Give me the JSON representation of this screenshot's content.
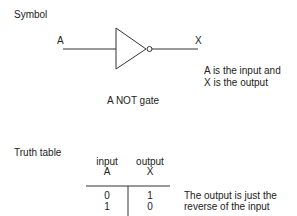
{
  "symbol_section": {
    "heading": "Symbol",
    "input_label": "A",
    "output_label": "X",
    "note_line1": "A is the input and",
    "note_line2": "X is the output",
    "caption": "A NOT gate"
  },
  "truth_table_section": {
    "heading": "Truth table",
    "columns": [
      {
        "header_line1": "input",
        "header_line2": "A"
      },
      {
        "header_line1": "output",
        "header_line2": "X"
      }
    ],
    "rows": [
      [
        "0",
        "1"
      ],
      [
        "1",
        "0"
      ]
    ],
    "note_line1": "The output is just the",
    "note_line2": "reverse of the input"
  },
  "colors": {
    "stroke": "#333333",
    "text": "#222222",
    "background": "#ffffff"
  }
}
